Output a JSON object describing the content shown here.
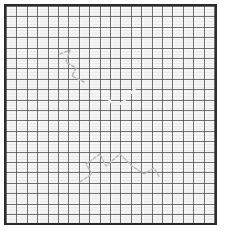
{
  "figure": {
    "canvas": {
      "width": 226,
      "height": 231,
      "background": "#ffffff"
    },
    "paper": {
      "x": 4,
      "y": 4,
      "width": 213,
      "height": 221,
      "fill": "#f4f4f4",
      "border_color": "#2b2b2b",
      "border_width": 2
    },
    "grid": {
      "cell_size_px": 10.4,
      "line_color": "#464646",
      "visible": true,
      "label": "graph-paper-grid"
    },
    "shapes": [
      {
        "name": "light-gray-upper-rectangle",
        "type": "rect",
        "x": 100,
        "y": 38,
        "width": 34,
        "height": 45,
        "fill": "#c8c8c8",
        "opacity": 1
      },
      {
        "name": "dark-gray-vertical-block",
        "type": "rect",
        "x": 88,
        "y": 82,
        "width": 55,
        "height": 29,
        "fill": "#767676",
        "opacity": 1
      },
      {
        "name": "dark-gray-horizontal-bar",
        "type": "rect",
        "x": 62,
        "y": 110,
        "width": 102,
        "height": 28,
        "fill": "#767676",
        "opacity": 1
      }
    ],
    "annotations": [
      {
        "name": "white-checkmark",
        "type": "polyline",
        "stroke": "#f2f2f2",
        "stroke_width": 2.2,
        "points": "105,95 113,105 121,100 136,83"
      },
      {
        "name": "faint-zigzag-upper-left",
        "type": "polyline",
        "stroke": "#b5b5b5",
        "stroke_width": 1.4,
        "dash": "3 2",
        "points": "58,52 68,48 64,60 74,66 70,74 82,80"
      },
      {
        "name": "faint-zigzag-lower",
        "type": "polyline",
        "stroke": "#bdbdbd",
        "stroke_width": 1.4,
        "dash": "3 2",
        "points": "78,180 90,172 84,162 98,152 104,164 118,152 130,164 142,172 152,166 158,176"
      }
    ],
    "legend": {
      "visible": false,
      "entries": []
    },
    "axes": {
      "visible": false,
      "xlabel": "",
      "ylabel": ""
    }
  }
}
